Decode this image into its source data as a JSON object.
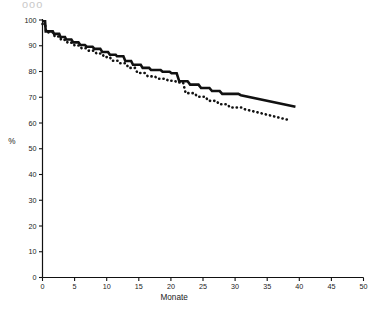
{
  "figure": {
    "header_text": "ooo",
    "background": "#ffffff",
    "ink_color": "#111111"
  },
  "chart_data": {
    "type": "line",
    "title": "",
    "subtitle": "",
    "xlabel": "Monate",
    "ylabel": "%",
    "xlim": [
      0,
      50
    ],
    "ylim": [
      0,
      100
    ],
    "xticks": [
      0,
      5,
      10,
      15,
      20,
      25,
      30,
      35,
      40,
      45,
      50
    ],
    "xtick_labels": [
      "0",
      "5",
      "10",
      "15",
      "20",
      "25",
      "30",
      "35",
      "40",
      "45",
      "50"
    ],
    "yticks": [
      0,
      10,
      20,
      30,
      40,
      50,
      60,
      70,
      80,
      90,
      100
    ],
    "ytick_labels": [
      "0",
      "10",
      "20",
      "30",
      "40",
      "50",
      "60",
      "70",
      "80",
      "90",
      "100"
    ],
    "grid": false,
    "legend_position": "none",
    "axis_style": "left-and-bottom-spines",
    "series": [
      {
        "name": "solid-curve",
        "style": "solid",
        "color": "#111111",
        "line_width": 2.6,
        "step": true,
        "points": [
          [
            0.0,
            99.5
          ],
          [
            0.4,
            99.5
          ],
          [
            0.5,
            95.6
          ],
          [
            1.6,
            95.6
          ],
          [
            1.8,
            94.6
          ],
          [
            2.6,
            94.6
          ],
          [
            2.8,
            93.4
          ],
          [
            3.5,
            93.4
          ],
          [
            3.7,
            92.4
          ],
          [
            4.5,
            92.4
          ],
          [
            4.8,
            91.3
          ],
          [
            5.6,
            91.3
          ],
          [
            5.9,
            90.3
          ],
          [
            6.6,
            90.3
          ],
          [
            6.9,
            89.6
          ],
          [
            7.8,
            89.6
          ],
          [
            8.1,
            88.8
          ],
          [
            9.0,
            88.8
          ],
          [
            9.3,
            87.6
          ],
          [
            10.2,
            87.6
          ],
          [
            10.5,
            86.5
          ],
          [
            11.4,
            86.5
          ],
          [
            11.6,
            85.9
          ],
          [
            12.6,
            85.9
          ],
          [
            12.9,
            84.1
          ],
          [
            13.8,
            84.1
          ],
          [
            14.1,
            82.6
          ],
          [
            15.3,
            82.6
          ],
          [
            15.6,
            81.4
          ],
          [
            16.6,
            81.4
          ],
          [
            16.9,
            80.6
          ],
          [
            18.4,
            80.6
          ],
          [
            18.7,
            79.9
          ],
          [
            19.8,
            79.9
          ],
          [
            20.1,
            79.3
          ],
          [
            20.9,
            79.3
          ],
          [
            21.3,
            76.2
          ],
          [
            22.6,
            76.2
          ],
          [
            23.0,
            74.9
          ],
          [
            24.3,
            74.9
          ],
          [
            24.7,
            73.6
          ],
          [
            26.0,
            73.6
          ],
          [
            26.4,
            72.4
          ],
          [
            27.6,
            72.4
          ],
          [
            28.0,
            71.3
          ],
          [
            30.5,
            71.3
          ],
          [
            30.9,
            70.8
          ],
          [
            39.4,
            66.3
          ]
        ]
      },
      {
        "name": "dotted-curve",
        "style": "dotted",
        "color": "#111111",
        "line_width": 2.6,
        "step": true,
        "points": [
          [
            0.0,
            98.4
          ],
          [
            0.4,
            98.4
          ],
          [
            0.6,
            95.2
          ],
          [
            1.7,
            95.2
          ],
          [
            1.9,
            93.6
          ],
          [
            2.7,
            93.6
          ],
          [
            2.9,
            92.3
          ],
          [
            3.7,
            92.3
          ],
          [
            3.9,
            91.2
          ],
          [
            4.7,
            91.2
          ],
          [
            5.0,
            90.1
          ],
          [
            5.8,
            90.1
          ],
          [
            6.1,
            89.0
          ],
          [
            6.9,
            89.0
          ],
          [
            7.2,
            88.1
          ],
          [
            8.1,
            88.1
          ],
          [
            8.4,
            87.0
          ],
          [
            9.3,
            87.0
          ],
          [
            9.6,
            85.6
          ],
          [
            10.5,
            85.6
          ],
          [
            10.8,
            84.2
          ],
          [
            11.7,
            84.2
          ],
          [
            12.0,
            83.2
          ],
          [
            13.0,
            83.2
          ],
          [
            13.4,
            81.4
          ],
          [
            14.4,
            81.4
          ],
          [
            14.8,
            79.4
          ],
          [
            16.0,
            79.4
          ],
          [
            16.4,
            78.1
          ],
          [
            17.5,
            78.1
          ],
          [
            17.9,
            77.2
          ],
          [
            19.2,
            77.2
          ],
          [
            19.6,
            76.4
          ],
          [
            20.6,
            76.4
          ],
          [
            21.0,
            75.7
          ],
          [
            21.9,
            75.7
          ],
          [
            22.3,
            71.6
          ],
          [
            23.7,
            71.6
          ],
          [
            24.1,
            70.2
          ],
          [
            25.4,
            70.2
          ],
          [
            25.8,
            68.6
          ],
          [
            27.1,
            68.6
          ],
          [
            27.5,
            67.3
          ],
          [
            28.8,
            67.3
          ],
          [
            29.2,
            66.0
          ],
          [
            31.0,
            66.0
          ],
          [
            31.4,
            65.4
          ],
          [
            38.3,
            61.2
          ]
        ]
      }
    ]
  }
}
